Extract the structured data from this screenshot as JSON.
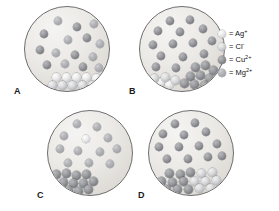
{
  "figure": {
    "background_color": "#ffffff",
    "vessel_fill_color": "#ecebe8",
    "vessel_outline_color": "#6d6d6d"
  },
  "legend": {
    "entries": [
      {
        "id": "ag",
        "swatch": "sphere-light",
        "equals": "=",
        "label": "Ag",
        "charge": "+",
        "color": "#ececed"
      },
      {
        "id": "cl",
        "swatch": "sphere-light-medium",
        "equals": "=",
        "label": "Cl",
        "charge": "-",
        "color": "#d9dadc"
      },
      {
        "id": "cu",
        "swatch": "sphere-dark",
        "equals": "=",
        "label": "Cu",
        "charge": "2+",
        "color": "#9a9b9f"
      },
      {
        "id": "mg",
        "swatch": "sphere-medium",
        "equals": "=",
        "label": "Mg",
        "charge": "2+",
        "color": "#b2b3b7"
      }
    ]
  },
  "panels": [
    {
      "id": "a",
      "letter": "A",
      "free_ions": [
        {
          "type": "mg",
          "x": 33,
          "y": 14
        },
        {
          "type": "cu",
          "x": 52,
          "y": 20
        },
        {
          "type": "mg",
          "x": 69,
          "y": 17
        },
        {
          "type": "cu",
          "x": 19,
          "y": 27
        },
        {
          "type": "mg",
          "x": 43,
          "y": 33
        },
        {
          "type": "cu",
          "x": 62,
          "y": 31
        },
        {
          "type": "mg",
          "x": 75,
          "y": 37
        },
        {
          "type": "cu",
          "x": 15,
          "y": 43
        },
        {
          "type": "mg",
          "x": 31,
          "y": 46
        },
        {
          "type": "cu",
          "x": 50,
          "y": 48
        },
        {
          "type": "mg",
          "x": 68,
          "y": 50
        },
        {
          "type": "cu",
          "x": 22,
          "y": 58
        },
        {
          "type": "mg",
          "x": 40,
          "y": 57
        },
        {
          "type": "cu",
          "x": 58,
          "y": 60
        },
        {
          "type": "mg",
          "x": 74,
          "y": 61
        }
      ],
      "precipitate": {
        "composition": "AgCl",
        "position": "bottom-center",
        "ions": [
          {
            "type": "ag",
            "x": 31,
            "y": 70
          },
          {
            "type": "ag",
            "x": 41,
            "y": 70
          },
          {
            "type": "ag",
            "x": 51,
            "y": 70
          },
          {
            "type": "ag",
            "x": 61,
            "y": 70
          },
          {
            "type": "ag",
            "x": 71,
            "y": 71
          },
          {
            "type": "cl",
            "x": 27,
            "y": 78
          },
          {
            "type": "cl",
            "x": 37,
            "y": 78
          },
          {
            "type": "cl",
            "x": 47,
            "y": 78
          },
          {
            "type": "cl",
            "x": 57,
            "y": 78
          },
          {
            "type": "cl",
            "x": 67,
            "y": 78
          },
          {
            "type": "cl",
            "x": 76,
            "y": 77
          }
        ]
      }
    },
    {
      "id": "b",
      "letter": "B",
      "free_ions": [
        {
          "type": "cu",
          "x": 30,
          "y": 14
        },
        {
          "type": "cu",
          "x": 50,
          "y": 13
        },
        {
          "type": "cu",
          "x": 18,
          "y": 24
        },
        {
          "type": "cu",
          "x": 40,
          "y": 25
        },
        {
          "type": "cu",
          "x": 63,
          "y": 22
        },
        {
          "type": "cu",
          "x": 13,
          "y": 38
        },
        {
          "type": "cu",
          "x": 33,
          "y": 37
        },
        {
          "type": "cu",
          "x": 53,
          "y": 36
        },
        {
          "type": "cu",
          "x": 72,
          "y": 34
        },
        {
          "type": "cu",
          "x": 21,
          "y": 49
        },
        {
          "type": "cu",
          "x": 43,
          "y": 50
        },
        {
          "type": "cu",
          "x": 64,
          "y": 47
        },
        {
          "type": "cu",
          "x": 16,
          "y": 60
        },
        {
          "type": "cu",
          "x": 36,
          "y": 61
        }
      ],
      "precipitate": {
        "composition": "AgCl",
        "position": "bottom-right",
        "ions": [
          {
            "type": "cu",
            "x": 55,
            "y": 60
          },
          {
            "type": "cu",
            "x": 65,
            "y": 58
          },
          {
            "type": "cu",
            "x": 73,
            "y": 63
          },
          {
            "type": "cu",
            "x": 50,
            "y": 69
          },
          {
            "type": "cu",
            "x": 60,
            "y": 68
          },
          {
            "type": "cu",
            "x": 69,
            "y": 71
          },
          {
            "type": "cu",
            "x": 44,
            "y": 76
          },
          {
            "type": "cu",
            "x": 54,
            "y": 77
          },
          {
            "type": "cu",
            "x": 64,
            "y": 78
          },
          {
            "type": "ag",
            "x": 20,
            "y": 75
          },
          {
            "type": "ag",
            "x": 29,
            "y": 77
          },
          {
            "type": "cl",
            "x": 25,
            "y": 70
          },
          {
            "type": "cl",
            "x": 35,
            "y": 73
          },
          {
            "type": "cl",
            "x": 14,
            "y": 71
          }
        ]
      }
    },
    {
      "id": "c",
      "letter": "C",
      "free_ions": [
        {
          "type": "mg",
          "x": 29,
          "y": 13
        },
        {
          "type": "mg",
          "x": 49,
          "y": 16
        },
        {
          "type": "mg",
          "x": 16,
          "y": 25
        },
        {
          "type": "ag",
          "x": 38,
          "y": 28
        },
        {
          "type": "mg",
          "x": 60,
          "y": 27
        },
        {
          "type": "mg",
          "x": 12,
          "y": 38
        },
        {
          "type": "mg",
          "x": 30,
          "y": 40
        },
        {
          "type": "mg",
          "x": 52,
          "y": 41
        },
        {
          "type": "mg",
          "x": 69,
          "y": 38
        },
        {
          "type": "mg",
          "x": 20,
          "y": 52
        },
        {
          "type": "mg",
          "x": 41,
          "y": 52
        },
        {
          "type": "mg",
          "x": 62,
          "y": 53
        }
      ],
      "precipitate": {
        "composition": "AgCl",
        "position": "bottom-left",
        "ions": [
          {
            "type": "cu",
            "x": 8,
            "y": 63
          },
          {
            "type": "cu",
            "x": 18,
            "y": 62
          },
          {
            "type": "cu",
            "x": 28,
            "y": 64
          },
          {
            "type": "cu",
            "x": 38,
            "y": 63
          },
          {
            "type": "cu",
            "x": 5,
            "y": 71
          },
          {
            "type": "cu",
            "x": 15,
            "y": 71
          },
          {
            "type": "cu",
            "x": 25,
            "y": 72
          },
          {
            "type": "cu",
            "x": 35,
            "y": 72
          },
          {
            "type": "cu",
            "x": 45,
            "y": 70
          },
          {
            "type": "cu",
            "x": 10,
            "y": 79
          },
          {
            "type": "cu",
            "x": 20,
            "y": 79
          },
          {
            "type": "cu",
            "x": 30,
            "y": 80
          },
          {
            "type": "cu",
            "x": 40,
            "y": 78
          }
        ]
      }
    },
    {
      "id": "d",
      "letter": "D",
      "free_ions": [
        {
          "type": "cu",
          "x": 26,
          "y": 13
        },
        {
          "type": "cu",
          "x": 46,
          "y": 12
        },
        {
          "type": "cu",
          "x": 14,
          "y": 23
        },
        {
          "type": "cu",
          "x": 35,
          "y": 24
        },
        {
          "type": "cu",
          "x": 57,
          "y": 21
        },
        {
          "type": "cu",
          "x": 10,
          "y": 36
        },
        {
          "type": "cu",
          "x": 30,
          "y": 36
        },
        {
          "type": "cu",
          "x": 50,
          "y": 35
        },
        {
          "type": "cu",
          "x": 68,
          "y": 33
        },
        {
          "type": "cu",
          "x": 18,
          "y": 48
        },
        {
          "type": "cu",
          "x": 39,
          "y": 48
        },
        {
          "type": "cu",
          "x": 59,
          "y": 46
        },
        {
          "type": "cu",
          "x": 73,
          "y": 45
        }
      ],
      "precipitate": {
        "composition": "AgCl",
        "position": "bottom-wide",
        "ions": [
          {
            "type": "cu",
            "x": 20,
            "y": 62
          },
          {
            "type": "cu",
            "x": 31,
            "y": 63
          },
          {
            "type": "cu",
            "x": 41,
            "y": 61
          },
          {
            "type": "cl",
            "x": 52,
            "y": 62
          },
          {
            "type": "cl",
            "x": 63,
            "y": 61
          },
          {
            "type": "cu",
            "x": 12,
            "y": 70
          },
          {
            "type": "cu",
            "x": 23,
            "y": 71
          },
          {
            "type": "cu",
            "x": 34,
            "y": 70
          },
          {
            "type": "cl",
            "x": 45,
            "y": 70
          },
          {
            "type": "cl",
            "x": 56,
            "y": 70
          },
          {
            "type": "cl",
            "x": 67,
            "y": 69
          },
          {
            "type": "cu",
            "x": 17,
            "y": 78
          },
          {
            "type": "cu",
            "x": 28,
            "y": 78
          },
          {
            "type": "cu",
            "x": 39,
            "y": 78
          },
          {
            "type": "cl",
            "x": 50,
            "y": 77
          },
          {
            "type": "cl",
            "x": 61,
            "y": 77
          }
        ]
      }
    }
  ]
}
